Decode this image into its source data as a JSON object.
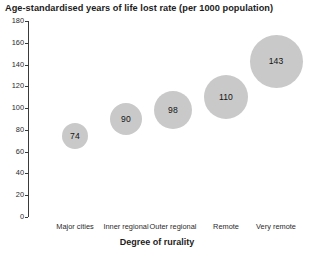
{
  "chart_data": {
    "type": "scatter",
    "title": "Age-standardised years of life lost rate (per 1000 population)",
    "xlabel": "Degree of rurality",
    "ylabel": "",
    "categories": [
      "Major cities",
      "Inner regional",
      "Outer regional",
      "Remote",
      "Very remote"
    ],
    "values": [
      74,
      90,
      98,
      110,
      143
    ],
    "data_labels": [
      "74",
      "90",
      "98",
      "110",
      "143"
    ],
    "bubble_sizes": [
      26,
      32,
      38,
      44,
      53
    ],
    "ylim": [
      0,
      180
    ],
    "ytick_labels": [
      "180",
      "160",
      "140",
      "120",
      "100",
      "80",
      "60",
      "40",
      "20",
      "0"
    ],
    "ytick_values": [
      180,
      160,
      140,
      120,
      100,
      80,
      60,
      40,
      20,
      0
    ],
    "grid": false,
    "legend": false,
    "marker_color": "#c9c9c9",
    "axis_color": "#3a3a3a",
    "text_color": "#1c1c1c",
    "background": "#ffffff"
  }
}
